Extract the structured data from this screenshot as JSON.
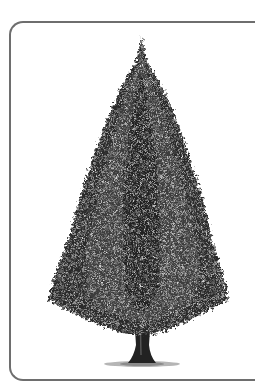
{
  "image": {
    "subject": "conifer-tree-illustration",
    "style": "grayscale engraving",
    "frame": {
      "border_color": "#6e6e6e",
      "corner": "rounded-left"
    },
    "colors": {
      "foliage_dark": "#1e1e1e",
      "foliage_mid": "#4a4a4a",
      "foliage_light": "#8a8a8a",
      "trunk": "#222222",
      "grass": "#9a9a9a"
    }
  }
}
